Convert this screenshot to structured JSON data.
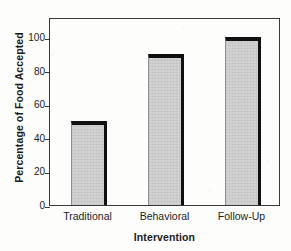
{
  "chart_data": {
    "type": "bar",
    "title": "",
    "subtitle": "",
    "xlabel": "Intervention",
    "ylabel": "Percentage of Food Accepted",
    "categories": [
      "Traditional",
      "Behavioral",
      "Follow-Up"
    ],
    "values": [
      50,
      90,
      100
    ],
    "series": [
      {
        "name": "Percentage of Food Accepted",
        "values": [
          50,
          90,
          100
        ]
      }
    ],
    "ylim": [
      0,
      112
    ],
    "xlim": [
      0,
      3
    ],
    "yticks": [
      0,
      20,
      40,
      60,
      80,
      100
    ],
    "ytick_labels": [
      "0",
      "20",
      "40",
      "60",
      "80",
      "100"
    ],
    "xtick_labels": [
      "Traditional",
      "Behavioral",
      "Follow-Up"
    ],
    "grid": false,
    "legend": false,
    "legend_position": "none",
    "annotations": [],
    "colors": {
      "bar_fill": "#d2d2d2",
      "bar_edge": "#101010",
      "axis": "#3a3a3a",
      "text": "#1a1a1a",
      "background": "#fdfdfc"
    }
  },
  "figure": {
    "y_axis_title": "Percentage of Food Accepted",
    "x_axis_title": "Intervention"
  }
}
